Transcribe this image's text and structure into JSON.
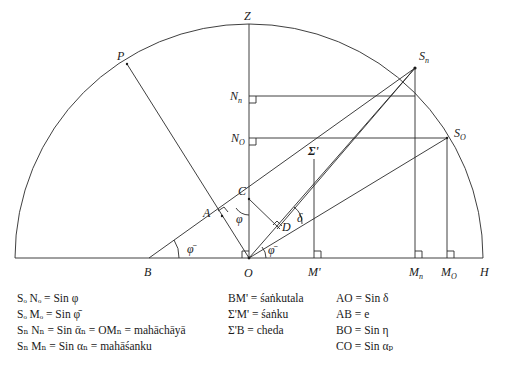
{
  "figure": {
    "points": {
      "Z": "Z",
      "P": "P",
      "N_n": "N",
      "N_n_sub": "n",
      "N_o": "N",
      "N_o_sub": "O",
      "S_n": "S",
      "S_n_sub": "n",
      "S_o": "S",
      "S_o_sub": "O",
      "Sigma_prime": "Σ'",
      "C": "C",
      "A": "A",
      "D": "D",
      "B": "B",
      "O": "O",
      "M_prime": "M'",
      "M_n": "M",
      "M_n_sub": "n",
      "M_o": "M",
      "M_o_sub": "O",
      "H": "H"
    },
    "angles": {
      "phi_bar_B": "φ̄",
      "phi_C": "φ",
      "phi_bar_O": "φ̄",
      "delta": "δ"
    }
  },
  "legend": {
    "col1": [
      "Sₒ Nₒ = Sin φ",
      "Sₒ Mₒ = Sin φ̄",
      "Sₙ Nₙ = Sin ᾱₙ = OMₙ = mahāchāyā",
      "Sₙ Mₙ = Sin αₙ = mahāśanku"
    ],
    "col2": [
      "BM' = śaṅkutala",
      "Σ'M' = śaṅku",
      "Σ'B = cheda"
    ],
    "col3": [
      "AO = Sin δ",
      "AB = e",
      "BO = Sin η",
      "CO = Sin αₚ"
    ]
  }
}
